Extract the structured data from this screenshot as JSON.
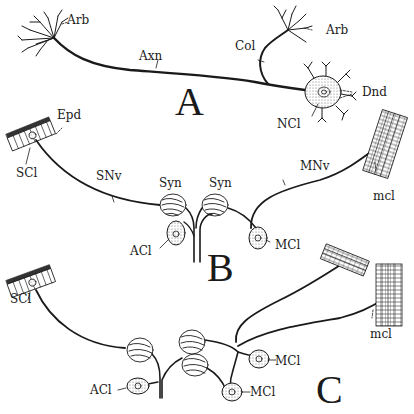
{
  "figure": {
    "panels": [
      {
        "id": "A",
        "letter": "A",
        "labels": {
          "arb_left": "Arb",
          "axn": "Axn",
          "col": "Col",
          "arb_right": "Arb",
          "dnd": "Dnd",
          "ncl": "NCl"
        }
      },
      {
        "id": "B",
        "letter": "B",
        "labels": {
          "epd": "Epd",
          "scl": "SCl",
          "snv": "SNv",
          "syn_left": "Syn",
          "syn_right": "Syn",
          "mnv": "MNv",
          "mcl_muscle": "mcl",
          "acl": "ACl",
          "mcl_cell": "MCl"
        }
      },
      {
        "id": "C",
        "letter": "C",
        "labels": {
          "scl": "SCl",
          "mcl_muscle": "mcl",
          "mcl_cell_upper": "MCl",
          "mcl_cell_lower": "MCl",
          "acl": "ACl"
        }
      }
    ],
    "colors": {
      "ink": "#1a1a1a",
      "paper": "#ffffff",
      "stipple": "#cfcfcf"
    }
  }
}
